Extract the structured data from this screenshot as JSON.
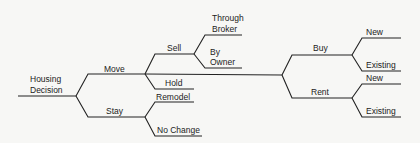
{
  "diagram": {
    "type": "decision-tree",
    "root": {
      "label": [
        "Housing",
        "Decision"
      ],
      "children": [
        {
          "label": [
            "Move"
          ],
          "children": [
            {
              "label": [
                "Sell"
              ],
              "children": [
                {
                  "label": [
                    "Through",
                    "Broker"
                  ],
                  "children": []
                },
                {
                  "label": [
                    "By",
                    "Owner"
                  ],
                  "children": []
                }
              ]
            },
            {
              "label": [],
              "children": [
                {
                  "label": [
                    "Buy"
                  ],
                  "children": [
                    {
                      "label": [
                        "New"
                      ],
                      "children": []
                    },
                    {
                      "label": [
                        "Existing"
                      ],
                      "children": []
                    }
                  ]
                },
                {
                  "label": [
                    "Rent"
                  ],
                  "children": [
                    {
                      "label": [
                        "New"
                      ],
                      "children": []
                    },
                    {
                      "label": [
                        "Existing"
                      ],
                      "children": []
                    }
                  ]
                }
              ]
            },
            {
              "label": [
                "Hold"
              ],
              "children": []
            }
          ]
        },
        {
          "label": [
            "Stay"
          ],
          "children": [
            {
              "label": [
                "Remodel"
              ],
              "children": []
            },
            {
              "label": [
                "No Change"
              ],
              "children": []
            }
          ]
        }
      ]
    }
  },
  "labels": {
    "housing_decision_1": "Housing",
    "housing_decision_2": "Decision",
    "move": "Move",
    "stay": "Stay",
    "sell": "Sell",
    "hold": "Hold",
    "remodel": "Remodel",
    "no_change": "No Change",
    "through_broker_1": "Through",
    "through_broker_2": "Broker",
    "by_owner_1": "By",
    "by_owner_2": "Owner",
    "buy": "Buy",
    "rent": "Rent",
    "buy_new": "New",
    "buy_existing": "Existing",
    "rent_new": "New",
    "rent_existing": "Existing"
  }
}
